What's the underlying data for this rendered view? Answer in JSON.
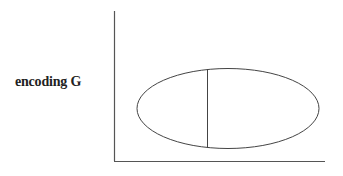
{
  "diagram": {
    "y_axis_label": "encoding G",
    "colors": {
      "stroke": "#555555",
      "text": "#222222",
      "background": "#ffffff"
    },
    "axes": {
      "y_axis": {
        "x": 114.5,
        "y_top": 11,
        "y_bottom": 161
      },
      "x_axis": {
        "y": 161.5,
        "x_left": 114,
        "x_right": 325
      }
    },
    "ellipse": {
      "cx": 228,
      "cy": 108.5,
      "rx": 91,
      "ry": 40
    },
    "divider_line": {
      "x": 207.5,
      "y_top": 69,
      "y_bottom": 148
    }
  }
}
